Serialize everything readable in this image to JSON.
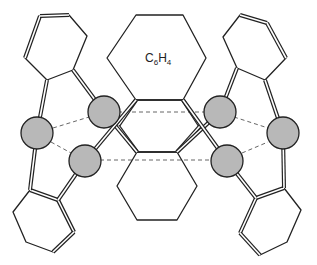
{
  "diagram": {
    "type": "molecular-structure",
    "central_label": {
      "main": "C",
      "sub1": "6",
      "mid": "H",
      "sub2": "4"
    },
    "colors": {
      "atom_fill": "#b8b8b8",
      "stroke": "#222222",
      "dash": "#555555"
    },
    "atoms": [
      {
        "id": "left-outer",
        "x": 37,
        "y": 133
      },
      {
        "id": "left-upper-inner",
        "x": 104,
        "y": 112
      },
      {
        "id": "left-lower-inner",
        "x": 85,
        "y": 161
      },
      {
        "id": "right-upper-inner",
        "x": 220,
        "y": 112
      },
      {
        "id": "right-outer",
        "x": 283,
        "y": 133
      },
      {
        "id": "right-lower-inner",
        "x": 227,
        "y": 161
      }
    ]
  }
}
